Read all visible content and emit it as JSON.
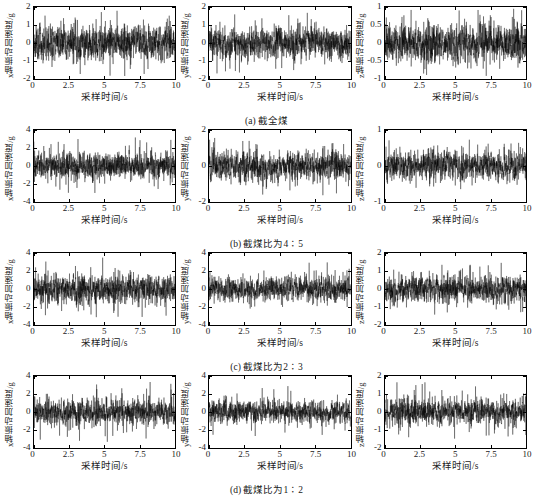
{
  "figure": {
    "columns": [
      "x",
      "y",
      "z"
    ],
    "xlabel": "采样时间/s",
    "xticks": [
      "0",
      "2.5",
      "5",
      "7.5",
      "10"
    ],
    "xlim": [
      0,
      10
    ],
    "ylabels": {
      "x": "x轴振动加速度/g",
      "y": "y轴振动加速度/g",
      "z": "z轴振动加速度/g"
    },
    "rows": [
      {
        "caption": "(a) 截全煤",
        "panels": [
          {
            "axis": "x",
            "yticks": [
              "2",
              "1",
              "0",
              "-1",
              "-2"
            ],
            "ylim": [
              -2,
              2
            ],
            "amplitude": 0.62,
            "peak": 1.85,
            "seed": 11
          },
          {
            "axis": "y",
            "yticks": [
              "2",
              "1",
              "0",
              "-1",
              "-2"
            ],
            "ylim": [
              -2,
              2
            ],
            "amplitude": 0.55,
            "peak": 1.7,
            "seed": 23
          },
          {
            "axis": "z",
            "yticks": [
              "1",
              "0.5",
              "0",
              "-0.5",
              "-1"
            ],
            "ylim": [
              -1,
              1
            ],
            "amplitude": 0.34,
            "peak": 0.95,
            "seed": 37
          }
        ]
      },
      {
        "caption": "(b) 截煤比为4∶5",
        "panels": [
          {
            "axis": "x",
            "yticks": [
              "4",
              "2",
              "0",
              "-2",
              "-4"
            ],
            "ylim": [
              -4,
              4
            ],
            "amplitude": 0.95,
            "peak": 3.2,
            "seed": 47
          },
          {
            "axis": "y",
            "yticks": [
              "2",
              "0",
              "-2"
            ],
            "ylim": [
              -3,
              3
            ],
            "amplitude": 0.78,
            "peak": 2.6,
            "seed": 59
          },
          {
            "axis": "z",
            "yticks": [
              "1",
              "0",
              "-1"
            ],
            "ylim": [
              -1.6,
              1.6
            ],
            "amplitude": 0.42,
            "peak": 1.4,
            "seed": 71
          }
        ]
      },
      {
        "caption": "(c) 截煤比为2∶3",
        "panels": [
          {
            "axis": "x",
            "yticks": [
              "4",
              "2",
              "0",
              "-2",
              "-4"
            ],
            "ylim": [
              -4,
              4
            ],
            "amplitude": 1.05,
            "peak": 3.5,
            "seed": 83
          },
          {
            "axis": "y",
            "yticks": [
              "4",
              "2",
              "0",
              "-2",
              "-4"
            ],
            "ylim": [
              -4,
              4
            ],
            "amplitude": 0.88,
            "peak": 3.0,
            "seed": 97
          },
          {
            "axis": "z",
            "yticks": [
              "2",
              "1",
              "0",
              "-1",
              "-2"
            ],
            "ylim": [
              -2,
              2
            ],
            "amplitude": 0.5,
            "peak": 1.6,
            "seed": 109
          }
        ]
      },
      {
        "caption": "(d) 截煤比为1∶2",
        "panels": [
          {
            "axis": "x",
            "yticks": [
              "4",
              "2",
              "0",
              "-2",
              "-4"
            ],
            "ylim": [
              -4,
              4
            ],
            "amplitude": 0.92,
            "peak": 3.4,
            "seed": 127
          },
          {
            "axis": "y",
            "yticks": [
              "4",
              "2",
              "0",
              "-2",
              "-4"
            ],
            "ylim": [
              -4,
              4
            ],
            "amplitude": 0.8,
            "peak": 3.1,
            "seed": 139
          },
          {
            "axis": "z",
            "yticks": [
              "2",
              "1",
              "0",
              "-1",
              "-2"
            ],
            "ylim": [
              -2,
              2
            ],
            "amplitude": 0.46,
            "peak": 1.7,
            "seed": 151
          }
        ]
      }
    ]
  },
  "chart_data": {
    "type": "line",
    "title": "",
    "subplot_grid": [
      4,
      3
    ],
    "xlabel": "采样时间/s",
    "xlim": [
      0,
      10
    ],
    "xticks": [
      0,
      2.5,
      5,
      7.5,
      10
    ],
    "grid": false,
    "legend": null,
    "signal_type": "vibration acceleration time series (random noise-like)",
    "subplots": [
      {
        "row": 0,
        "col": 0,
        "caption": "(a) 截全煤",
        "ylabel": "x轴振动加速度/g",
        "ylim": [
          -2,
          2
        ],
        "yticks": [
          2,
          1,
          0,
          -1,
          -2
        ],
        "rms_estimate": 0.62,
        "peak_estimate": 1.85
      },
      {
        "row": 0,
        "col": 1,
        "caption": "(a) 截全煤",
        "ylabel": "y轴振动加速度/g",
        "ylim": [
          -2,
          2
        ],
        "yticks": [
          2,
          1,
          0,
          -1,
          -2
        ],
        "rms_estimate": 0.55,
        "peak_estimate": 1.7
      },
      {
        "row": 0,
        "col": 2,
        "caption": "(a) 截全煤",
        "ylabel": "z轴振动加速度/g",
        "ylim": [
          -1,
          1
        ],
        "yticks": [
          1,
          0.5,
          0,
          -0.5,
          -1
        ],
        "rms_estimate": 0.34,
        "peak_estimate": 0.95
      },
      {
        "row": 1,
        "col": 0,
        "caption": "(b) 截煤比为4∶5",
        "ylabel": "x轴振动加速度/g",
        "ylim": [
          -4,
          4
        ],
        "yticks": [
          4,
          2,
          0,
          -2,
          -4
        ],
        "rms_estimate": 0.95,
        "peak_estimate": 3.2
      },
      {
        "row": 1,
        "col": 1,
        "caption": "(b) 截煤比为4∶5",
        "ylabel": "y轴振动加速度/g",
        "ylim": [
          -3,
          3
        ],
        "yticks": [
          2,
          0,
          -2
        ],
        "rms_estimate": 0.78,
        "peak_estimate": 2.6
      },
      {
        "row": 1,
        "col": 2,
        "caption": "(b) 截煤比为4∶5",
        "ylabel": "z轴振动加速度/g",
        "ylim": [
          -1.6,
          1.6
        ],
        "yticks": [
          1,
          0,
          -1
        ],
        "rms_estimate": 0.42,
        "peak_estimate": 1.4
      },
      {
        "row": 2,
        "col": 0,
        "caption": "(c) 截煤比为2∶3",
        "ylabel": "x轴振动加速度/g",
        "ylim": [
          -4,
          4
        ],
        "yticks": [
          4,
          2,
          0,
          -2,
          -4
        ],
        "rms_estimate": 1.05,
        "peak_estimate": 3.5
      },
      {
        "row": 2,
        "col": 1,
        "caption": "(c) 截煤比为2∶3",
        "ylabel": "y轴振动加速度/g",
        "ylim": [
          -4,
          4
        ],
        "yticks": [
          4,
          2,
          0,
          -2,
          -4
        ],
        "rms_estimate": 0.88,
        "peak_estimate": 3.0
      },
      {
        "row": 2,
        "col": 2,
        "caption": "(c) 截煤比为2∶3",
        "ylabel": "z轴振动加速度/g",
        "ylim": [
          -2,
          2
        ],
        "yticks": [
          2,
          1,
          0,
          -1,
          -2
        ],
        "rms_estimate": 0.5,
        "peak_estimate": 1.6
      },
      {
        "row": 3,
        "col": 0,
        "caption": "(d) 截煤比为1∶2",
        "ylabel": "x轴振动加速度/g",
        "ylim": [
          -4,
          4
        ],
        "yticks": [
          4,
          2,
          0,
          -2,
          -4
        ],
        "rms_estimate": 0.92,
        "peak_estimate": 3.4
      },
      {
        "row": 3,
        "col": 1,
        "caption": "(d) 截煤比为1∶2",
        "ylabel": "y轴振动加速度/g",
        "ylim": [
          -4,
          4
        ],
        "yticks": [
          4,
          2,
          0,
          -2,
          -4
        ],
        "rms_estimate": 0.8,
        "peak_estimate": 3.1
      },
      {
        "row": 3,
        "col": 2,
        "caption": "(d) 截煤比为1∶2",
        "ylabel": "z轴振动加速度/g",
        "ylim": [
          -2,
          2
        ],
        "yticks": [
          2,
          1,
          0,
          -1,
          -2
        ],
        "rms_estimate": 0.46,
        "peak_estimate": 1.7
      }
    ]
  }
}
